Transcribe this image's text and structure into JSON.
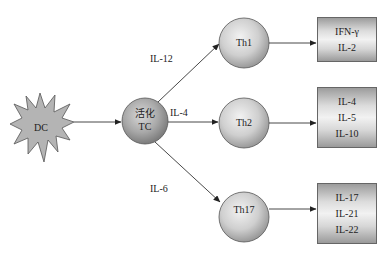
{
  "diagram": {
    "source": {
      "id": "dc",
      "label": "DC",
      "shape": "star"
    },
    "hub": {
      "id": "tc",
      "label_line1": "活化",
      "label_line2": "TC",
      "shape": "circle"
    },
    "subsets": [
      {
        "id": "th1",
        "label": "Th1",
        "cytokine_in": "IL-12",
        "outputs": [
          "IFN-γ",
          "IL-2"
        ]
      },
      {
        "id": "th2",
        "label": "Th2",
        "cytokine_in": "IL-4",
        "outputs": [
          "IL-4",
          "IL-5",
          "IL-10"
        ]
      },
      {
        "id": "th17",
        "label": "Th17",
        "cytokine_in": "IL-6",
        "outputs": [
          "IL-17",
          "IL-21",
          "IL-22"
        ]
      }
    ],
    "edges": [
      {
        "from": "DC",
        "to": "活化 TC"
      },
      {
        "from": "活化 TC",
        "to": "Th1",
        "label": "IL-12"
      },
      {
        "from": "活化 TC",
        "to": "Th2",
        "label": "IL-4"
      },
      {
        "from": "活化 TC",
        "to": "Th17",
        "label": "IL-6"
      },
      {
        "from": "Th1",
        "to": "IFN-γ / IL-2"
      },
      {
        "from": "Th2",
        "to": "IL-4 / IL-5 / IL-10"
      },
      {
        "from": "Th17",
        "to": "IL-17 / IL-21 / IL-22"
      }
    ],
    "colors": {
      "node_fill_light": "#eeeeee",
      "node_fill_dark": "#a0a0a0",
      "stroke": "#555555",
      "line": "#333333"
    }
  }
}
